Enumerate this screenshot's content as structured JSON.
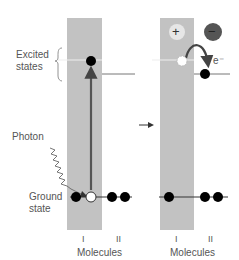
{
  "labels": {
    "excited_states": [
      "Excited",
      "states"
    ],
    "photon": "Photon",
    "ground_state": [
      "Ground",
      "state"
    ],
    "electron": "e⁻",
    "plus": "+",
    "minus": "−"
  },
  "panels": [
    {
      "id": "before",
      "molecule_labels": [
        "I",
        "II"
      ],
      "axis_label": "Molecules"
    },
    {
      "id": "after",
      "molecule_labels": [
        "I",
        "II"
      ],
      "axis_label": "Molecules"
    }
  ],
  "colors": {
    "panel": "#c2c2c2",
    "line": "#333333",
    "excited_line": "#f0f0f0",
    "arrow": "#555555",
    "plus_circle": "#e4e4e4",
    "minus_circle": "#555555",
    "electron_dot": "#000000",
    "hole_dot": "#ffffff"
  }
}
